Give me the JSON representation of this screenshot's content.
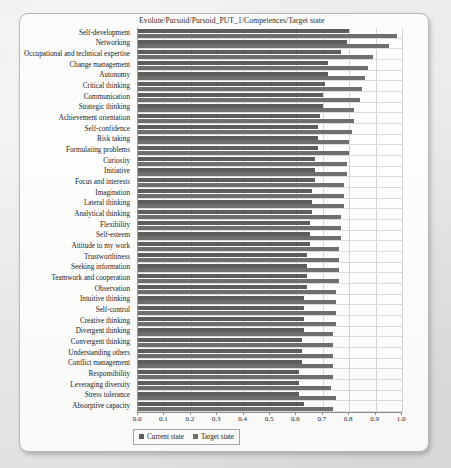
{
  "chart_data": {
    "type": "bar",
    "orientation": "horizontal",
    "title": "Evolute/Pursoid/Pursoid_PUT_1/Competences/Target state",
    "xlabel": "",
    "ylabel": "",
    "xlim": [
      0.0,
      1.0
    ],
    "grid": true,
    "legend_position": "bottom",
    "xticks": [
      "0.0",
      "0.1",
      "0.2",
      "0.3",
      "0.4",
      "0.5",
      "0.6",
      "0.7",
      "0.8",
      "0.9",
      "1.0"
    ],
    "xtick_values": [
      0.0,
      0.1,
      0.2,
      0.3,
      0.4,
      0.5,
      0.6,
      0.7,
      0.8,
      0.9,
      1.0
    ],
    "categories": [
      "Self-development",
      "Networking",
      "Occupational and technical expertise",
      "Change management",
      "Autonomy",
      "Critical thinking",
      "Communication",
      "Strategic thinking",
      "Achievement orientation",
      "Self-confidence",
      "Risk taking",
      "Formulating problems",
      "Curiosity",
      "Initiative",
      "Focus and interests",
      "Imagination",
      "Lateral thinking",
      "Analytical thinking",
      "Flexibility",
      "Self-esteem",
      "Attitude to my work",
      "Trustworthiness",
      "Seeking information",
      "Teamwork and cooperation",
      "Observation",
      "Intuitive thinking",
      "Self-control",
      "Creative thinking",
      "Divergent thinking",
      "Convergent thinking",
      "Understanding others",
      "Conflict management",
      "Responsibility",
      "Leveraging diversity",
      "Stress tolerance",
      "Absorptive capacity"
    ],
    "series": [
      {
        "name": "Current state",
        "color": "#5d5d5c",
        "values": [
          0.8,
          0.79,
          0.77,
          0.72,
          0.72,
          0.71,
          0.7,
          0.7,
          0.69,
          0.68,
          0.68,
          0.68,
          0.67,
          0.67,
          0.67,
          0.66,
          0.66,
          0.66,
          0.65,
          0.65,
          0.65,
          0.64,
          0.64,
          0.64,
          0.64,
          0.63,
          0.63,
          0.63,
          0.63,
          0.62,
          0.62,
          0.62,
          0.61,
          0.61,
          0.61,
          0.63
        ]
      },
      {
        "name": "Target state",
        "color": "#6f6f6e",
        "values": [
          0.98,
          0.95,
          0.89,
          0.87,
          0.86,
          0.85,
          0.84,
          0.82,
          0.82,
          0.81,
          0.8,
          0.8,
          0.79,
          0.79,
          0.78,
          0.78,
          0.78,
          0.77,
          0.77,
          0.77,
          0.76,
          0.76,
          0.76,
          0.76,
          0.75,
          0.75,
          0.75,
          0.75,
          0.74,
          0.74,
          0.74,
          0.74,
          0.74,
          0.73,
          0.75,
          0.74
        ]
      }
    ]
  },
  "legend": {
    "items": [
      {
        "label": "Current state",
        "swatch": "sw-current"
      },
      {
        "label": "Target state",
        "swatch": "sw-target"
      }
    ]
  }
}
